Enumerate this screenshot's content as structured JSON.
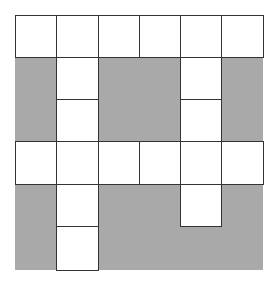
{
  "diagram": {
    "title": "",
    "colors": {
      "shade": "#a9a9a9",
      "white": "#ffffff",
      "line": "#333333"
    },
    "cols": 6,
    "rows": 6,
    "grid": [
      [
        1,
        1,
        1,
        1,
        1,
        1
      ],
      [
        0,
        1,
        0,
        0,
        1,
        0
      ],
      [
        0,
        1,
        0,
        0,
        1,
        0
      ],
      [
        1,
        1,
        1,
        1,
        1,
        1
      ],
      [
        0,
        1,
        0,
        0,
        1,
        0
      ],
      [
        0,
        1,
        0,
        0,
        0,
        0
      ]
    ]
  }
}
